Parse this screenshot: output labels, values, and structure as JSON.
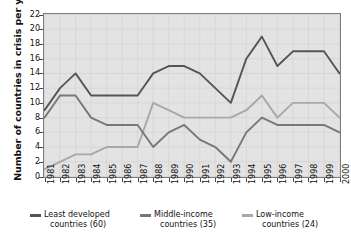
{
  "chart_data": {
    "type": "line",
    "title": "",
    "xlabel": "",
    "ylabel": "Number of countries in crisis per year",
    "ylim": [
      0,
      22
    ],
    "ytick_step": 2,
    "yticks": [
      0,
      2,
      4,
      6,
      8,
      10,
      12,
      14,
      16,
      18,
      20,
      22
    ],
    "grid": true,
    "legend_position": "below",
    "categories": [
      "1981",
      "1982",
      "1983",
      "1984",
      "1985",
      "1986",
      "1987",
      "1988",
      "1989",
      "1990",
      "1991",
      "1992",
      "1993",
      "1994",
      "1995",
      "1996",
      "1997",
      "1998",
      "1999",
      "2000"
    ],
    "series": [
      {
        "name": "Least developed countries (60)",
        "color": "#555555",
        "values": [
          9,
          12,
          14,
          11,
          11,
          11,
          11,
          14,
          15,
          15,
          14,
          12,
          10,
          16,
          19,
          15,
          17,
          17,
          17,
          14
        ]
      },
      {
        "name": "Middle-income countries (35)",
        "color": "#777777",
        "values": [
          8,
          11,
          11,
          8,
          7,
          7,
          7,
          4,
          6,
          7,
          5,
          4,
          2,
          6,
          8,
          7,
          7,
          7,
          7,
          6
        ]
      },
      {
        "name": "Low-income countries (24)",
        "color": "#a8a8a8",
        "values": [
          1,
          2,
          3,
          3,
          4,
          4,
          4,
          10,
          9,
          8,
          8,
          8,
          8,
          9,
          11,
          8,
          10,
          10,
          10,
          8
        ]
      }
    ]
  },
  "legend": {
    "items": [
      {
        "line1": "Least developed",
        "line2": "countries (60)",
        "color": "#555555"
      },
      {
        "line1": "Middle-income",
        "line2": "countries (35)",
        "color": "#777777"
      },
      {
        "line1": "Low-income",
        "line2": "countries (24)",
        "color": "#a8a8a8"
      }
    ]
  },
  "colors": {
    "plot_background": "#e3e3e3",
    "page_background": "#ffffff",
    "axis": "#7d7d7d",
    "grid": "#d2d2d2",
    "text": "#111111"
  }
}
